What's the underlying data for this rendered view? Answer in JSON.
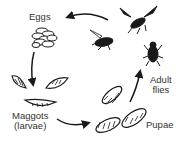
{
  "diagram": {
    "stages": [
      {
        "id": "eggs",
        "label": "Eggs"
      },
      {
        "id": "maggots",
        "label_line1": "Maggots",
        "label_line2": "(larvae)"
      },
      {
        "id": "pupae",
        "label": "Pupae"
      },
      {
        "id": "adult",
        "label_line1": "Adult",
        "label_line2": "flies"
      }
    ],
    "cycle_order": [
      "Eggs",
      "Maggots (larvae)",
      "Pupae",
      "Adult flies"
    ],
    "colors": {
      "ink": "#1a1a1a",
      "text": "#333333",
      "background": "#ffffff"
    }
  }
}
